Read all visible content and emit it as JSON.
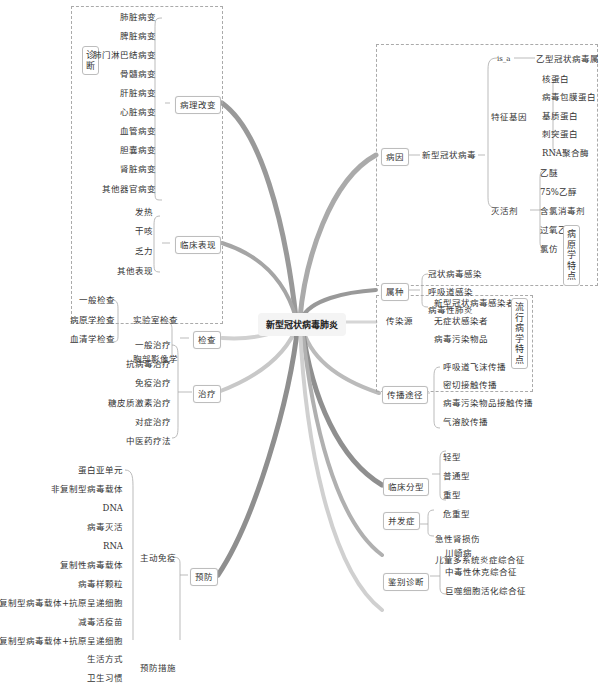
{
  "center": {
    "label": "新型冠状病毒肺炎"
  },
  "left": {
    "region_label": "诊断",
    "pathology": {
      "label": "病理改变",
      "items": [
        "肺脏病变",
        "脾脏病变",
        "肺门淋巴结病变",
        "骨髓病变",
        "肝脏病变",
        "心脏病变",
        "血管病变",
        "胆囊病变",
        "肾脏病变",
        "其他器官病变"
      ]
    },
    "clinical": {
      "label": "临床表现",
      "items": [
        "发热",
        "干咳",
        "乏力",
        "其他表现"
      ]
    },
    "exam": {
      "label": "检查",
      "lab": {
        "label": "实验室检查",
        "items": [
          "一般检查",
          "病原学检查",
          "血清学检查"
        ]
      },
      "imaging": "胸部影像学"
    },
    "treatment": {
      "label": "治疗",
      "items": [
        "一般治疗",
        "抗病毒治疗",
        "免疫治疗",
        "糖皮质激素治疗",
        "对症治疗",
        "中医药疗法"
      ]
    },
    "prevention": {
      "label": "预防",
      "active": {
        "label": "主动免疫",
        "items": [
          "蛋白亚单元",
          "非复制型病毒载体",
          "DNA",
          "病毒灭活",
          "RNA",
          "复制性病毒载体",
          "病毒样颗粒",
          "复制型病毒载体+抗原呈递细胞",
          "减毒活疫苗",
          "非复制型病毒载体+抗原呈递细胞"
        ]
      },
      "measures": {
        "label": "预防措施",
        "items": [
          "生活方式",
          "卫生习惯"
        ]
      }
    }
  },
  "right": {
    "pathogen_region_label": "病原学特点",
    "cause": {
      "label": "病因",
      "virus": "新型冠状病毒",
      "is_a": {
        "label": "is_a",
        "value": "乙型冠状病毒属"
      },
      "genes": {
        "label": "特征基因",
        "items": [
          "核蛋白",
          "病毒包膜蛋白",
          "基质蛋白",
          "刺突蛋白",
          "RNA聚合酶"
        ]
      },
      "inactivators": {
        "label": "灭活剂",
        "items": [
          "乙醚",
          "75%乙醇",
          "含氯消毒剂",
          "过氧乙酸",
          "氯仿"
        ]
      }
    },
    "genus": {
      "label": "属种",
      "items": [
        "冠状病毒感染",
        "呼吸道感染",
        "病毒性肺炎"
      ]
    },
    "epi_region_label": "流行病学特点",
    "source": {
      "label": "传染源",
      "items": [
        "新型冠状病毒感染者",
        "无症状感染者",
        "病毒污染物品"
      ]
    },
    "route": {
      "label": "传播途径",
      "items": [
        "呼吸道飞沫传播",
        "密切接触传播",
        "病毒污染物品接触传播",
        "气溶胶传播"
      ]
    },
    "types": {
      "label": "临床分型",
      "items": [
        "轻型",
        "普通型",
        "重型",
        "危重型"
      ]
    },
    "complications": {
      "label": "并发症",
      "items": [
        "急性肾损伤",
        "儿童多系统炎症综合征"
      ]
    },
    "differential": {
      "label": "鉴别诊断",
      "items": [
        "川崎病",
        "中毒性休克综合征",
        "巨噬细胞活化综合征"
      ]
    }
  },
  "colors": {
    "branch_dark": "#8a8a8a",
    "branch_light": "#c8c8c8",
    "line": "#aaaaaa",
    "border": "#bdbdbd"
  }
}
